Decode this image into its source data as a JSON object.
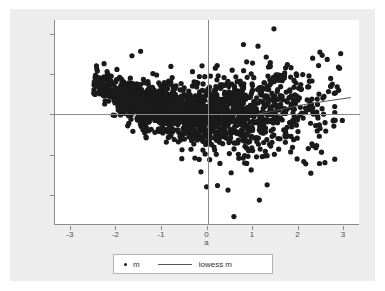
{
  "chart_data": {
    "type": "scatter",
    "title": "",
    "xlabel": "a",
    "ylabel": "m/lowess m",
    "xlim": [
      -3.35,
      3.35
    ],
    "ylim": [
      -2.75,
      2.35
    ],
    "xticks": [
      -3,
      -2,
      -1,
      0,
      1,
      2,
      3
    ],
    "xticklabels": [
      "-3",
      "-2",
      "-1",
      "0",
      "1",
      "2",
      "3"
    ],
    "yticks": [
      -2,
      -1,
      0,
      1,
      2
    ],
    "yticklabels": [
      "-2",
      "-1",
      "0",
      "1",
      "2"
    ],
    "grid": false,
    "reference_lines": [
      {
        "name": "zero-horizontal",
        "orientation": "horizontal",
        "value": 0
      },
      {
        "name": "zero-vertical",
        "orientation": "vertical",
        "value": 0
      }
    ],
    "legend_position": "bottom-center",
    "series": [
      {
        "name": "m",
        "marker": "circle",
        "color": "#1a1a1a",
        "marker_size": 2.6,
        "n_points": 1850,
        "description": "Dense point cloud of m versus a; funnel shaped, widening toward positive a.",
        "shape_model": {
          "x_range": [
            -2.55,
            3.15
          ],
          "center_trend": [
            {
              "x": -2.5,
              "y": 0.78
            },
            {
              "x": -2.0,
              "y": 0.5
            },
            {
              "x": -1.5,
              "y": 0.28
            },
            {
              "x": -1.0,
              "y": 0.12
            },
            {
              "x": -0.5,
              "y": 0.02
            },
            {
              "x": 0.0,
              "y": -0.02
            },
            {
              "x": 0.5,
              "y": 0.0
            },
            {
              "x": 1.0,
              "y": 0.06
            },
            {
              "x": 1.5,
              "y": 0.14
            },
            {
              "x": 2.0,
              "y": 0.22
            },
            {
              "x": 2.5,
              "y": 0.3
            },
            {
              "x": 3.0,
              "y": 0.38
            }
          ],
          "spread": [
            {
              "x": -2.5,
              "sd": 0.17
            },
            {
              "x": -2.0,
              "sd": 0.22
            },
            {
              "x": -1.5,
              "sd": 0.28
            },
            {
              "x": -1.0,
              "sd": 0.34
            },
            {
              "x": -0.5,
              "sd": 0.38
            },
            {
              "x": 0.0,
              "sd": 0.4
            },
            {
              "x": 0.5,
              "sd": 0.44
            },
            {
              "x": 1.0,
              "sd": 0.5
            },
            {
              "x": 1.5,
              "sd": 0.56
            },
            {
              "x": 2.0,
              "sd": 0.58
            },
            {
              "x": 2.5,
              "sd": 0.6
            },
            {
              "x": 3.0,
              "sd": 0.58
            }
          ],
          "density": [
            {
              "x": -2.5,
              "w": 0.25
            },
            {
              "x": -2.0,
              "w": 0.55
            },
            {
              "x": -1.5,
              "w": 0.85
            },
            {
              "x": -1.0,
              "w": 1.0
            },
            {
              "x": -0.5,
              "w": 1.0
            },
            {
              "x": 0.0,
              "w": 0.95
            },
            {
              "x": 0.5,
              "w": 0.85
            },
            {
              "x": 1.0,
              "w": 0.62
            },
            {
              "x": 1.5,
              "w": 0.4
            },
            {
              "x": 2.0,
              "w": 0.24
            },
            {
              "x": 2.5,
              "w": 0.14
            },
            {
              "x": 3.0,
              "w": 0.09
            }
          ],
          "outliers": [
            {
              "x": 1.46,
              "y": 2.13
            },
            {
              "x": 0.79,
              "y": 1.74
            },
            {
              "x": 1.11,
              "y": 1.7
            },
            {
              "x": -1.47,
              "y": 1.57
            },
            {
              "x": 2.47,
              "y": 1.55
            },
            {
              "x": 2.52,
              "y": 1.47
            },
            {
              "x": 1.29,
              "y": 1.43
            },
            {
              "x": 2.31,
              "y": 1.4
            },
            {
              "x": -1.66,
              "y": 1.46
            },
            {
              "x": 2.63,
              "y": 1.37
            },
            {
              "x": 0.86,
              "y": 1.31
            },
            {
              "x": 1.38,
              "y": 1.29
            },
            {
              "x": -0.12,
              "y": 1.21
            },
            {
              "x": -2.42,
              "y": 1.08
            },
            {
              "x": -1.99,
              "y": 1.12
            },
            {
              "x": 0.58,
              "y": -2.54
            },
            {
              "x": 1.14,
              "y": -2.13
            },
            {
              "x": 0.45,
              "y": -1.88
            },
            {
              "x": -0.02,
              "y": -1.8
            },
            {
              "x": 0.22,
              "y": -1.77
            },
            {
              "x": 1.31,
              "y": -1.75
            },
            {
              "x": 0.52,
              "y": -1.45
            },
            {
              "x": 0.96,
              "y": -1.38
            },
            {
              "x": 2.46,
              "y": -1.22
            },
            {
              "x": 2.58,
              "y": -1.2
            },
            {
              "x": 2.27,
              "y": -1.46
            }
          ]
        }
      },
      {
        "name": "lowess m",
        "marker": "none",
        "line": true,
        "color": "#555555",
        "description": "Lowess smoother, nearly flat at zero then rising on the right.",
        "points": [
          {
            "x": 1.1,
            "y": 0.01
          },
          {
            "x": 1.4,
            "y": 0.07
          },
          {
            "x": 1.7,
            "y": 0.15
          },
          {
            "x": 2.0,
            "y": 0.22
          },
          {
            "x": 2.3,
            "y": 0.28
          },
          {
            "x": 2.6,
            "y": 0.33
          },
          {
            "x": 2.9,
            "y": 0.38
          },
          {
            "x": 3.15,
            "y": 0.42
          }
        ]
      }
    ],
    "legend": [
      {
        "label": "m",
        "marker": "dot"
      },
      {
        "label": "lowess m",
        "marker": "line"
      }
    ]
  },
  "colors": {
    "figure_background": "#ededed",
    "plot_background": "#ffffff",
    "axis": "#8a8a8a",
    "marker": "#1a1a1a",
    "smoother": "#555555",
    "text": "#4d4d4d",
    "legend_border": "#b4b4b4"
  }
}
